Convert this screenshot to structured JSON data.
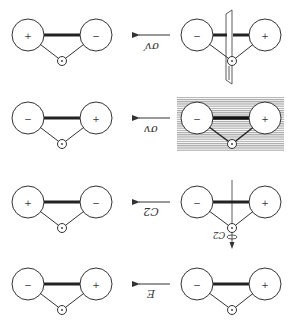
{
  "diagram": {
    "rows": [
      {
        "operation": "σv′",
        "label_rotated_180": true,
        "before": {
          "left_sign": "−",
          "right_sign": "+",
          "decoration": "vertical mirror plane perpendicular to molecular plane"
        },
        "after": {
          "left_sign": "+",
          "right_sign": "−"
        }
      },
      {
        "operation": "σv",
        "label_rotated_180": true,
        "before": {
          "left_sign": "−",
          "right_sign": "+",
          "decoration": "shaded mirror plane in molecular plane"
        },
        "after": {
          "left_sign": "−",
          "right_sign": "+"
        }
      },
      {
        "operation": "C2",
        "label_rotated_180": true,
        "before": {
          "left_sign": "−",
          "right_sign": "+",
          "decoration": "C2 rotation axis with rotation arrow",
          "axis_label": "C2"
        },
        "after": {
          "left_sign": "+",
          "right_sign": "−"
        }
      },
      {
        "operation": "E",
        "label_rotated_180": true,
        "before": {
          "left_sign": "−",
          "right_sign": "+",
          "decoration": "none"
        },
        "after": {
          "left_sign": "−",
          "right_sign": "+"
        }
      }
    ],
    "colors": {
      "line": "#333333",
      "shading": "#bdbdbd",
      "background": "#ffffff"
    }
  }
}
